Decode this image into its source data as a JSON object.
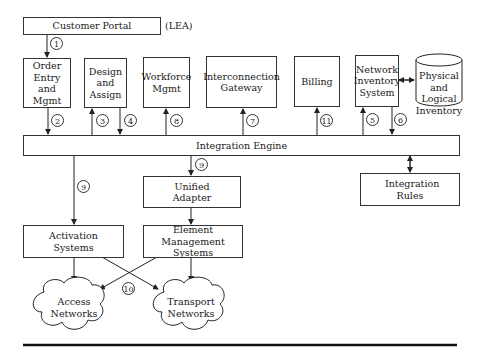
{
  "diagram": {
    "customer_portal": "Customer Portal",
    "lea_label": "(LEA)",
    "order_entry": "Order Entry and Mgmt",
    "design_assign": "Design and Assign",
    "workforce": "Workforce Mgmt",
    "interconnection": "Interconnection Gateway",
    "billing": "Billing",
    "network_inventory": "Network Inventory System",
    "physical_logical": "Physical and Logical Inventory",
    "integration_engine": "Integration Engine",
    "unified_adapter": "Unified Adapter",
    "integration_rules": "Integration Rules",
    "activation": "Activation Systems",
    "element_mgmt": "Element Management Systems",
    "access_networks": "Access Networks",
    "transport_networks": "Transport Networks",
    "steps": {
      "s1": "1",
      "s2": "2",
      "s3": "3",
      "s4": "4",
      "s5": "5",
      "s6": "6",
      "s7": "7",
      "s8": "8",
      "s9a": "9",
      "s9b": "9",
      "s10": "10",
      "s11": "11"
    }
  }
}
